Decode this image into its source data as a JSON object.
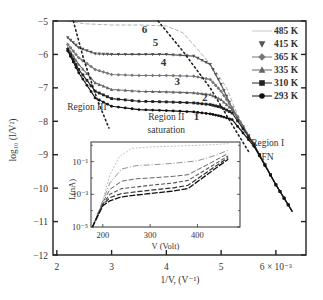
{
  "chart_data": {
    "type": "scatter",
    "title": "",
    "xlabel": "1/V, (V⁻¹)",
    "ylabel": "log10 (I/V²)",
    "xlim": [
      1.93,
      6.55
    ],
    "ylim": [
      -12,
      -5
    ],
    "x_ticks": [
      2,
      3,
      4,
      5,
      6
    ],
    "x_tick_labels": [
      "2",
      "3",
      "4",
      "5",
      "6 × 10⁻³"
    ],
    "y_ticks": [
      -5,
      -6,
      -7,
      -8,
      -9,
      -10,
      -11,
      -12
    ],
    "y_tick_labels": [
      "−5",
      "−6",
      "−7",
      "−8",
      "−9",
      "−10",
      "−11",
      "−12"
    ],
    "grid": false,
    "legend_position": "upper right",
    "legend": [
      "485 K",
      "415 K",
      "365 K",
      "335 K",
      "310 K",
      "293 K"
    ],
    "series": [
      {
        "name": "485 K",
        "curve_label": "6",
        "marker": "none",
        "color": "#b0b0b0",
        "x": [
          2.2,
          2.5,
          3.0,
          3.5,
          4.0,
          4.3,
          4.6,
          4.9,
          5.1,
          5.3,
          5.6,
          6.0,
          6.3
        ],
        "y": [
          -5.0,
          -5.08,
          -5.12,
          -5.12,
          -5.15,
          -5.35,
          -5.9,
          -6.5,
          -7.0,
          -7.8,
          -8.7,
          -9.9,
          -10.7
        ]
      },
      {
        "name": "415 K",
        "curve_label": "5",
        "marker": "triangle-down",
        "color": "#555555",
        "x": [
          2.2,
          2.4,
          2.7,
          3.0,
          3.5,
          4.0,
          4.5,
          4.8,
          5.0,
          5.2,
          5.6,
          6.0,
          6.3
        ],
        "y": [
          -5.5,
          -5.8,
          -5.98,
          -6.0,
          -6.0,
          -6.0,
          -6.05,
          -6.3,
          -6.9,
          -7.6,
          -8.7,
          -9.9,
          -10.7
        ]
      },
      {
        "name": "365 K",
        "curve_label": "4",
        "marker": "diamond",
        "color": "#777777",
        "x": [
          2.2,
          2.4,
          2.7,
          3.0,
          3.5,
          4.0,
          4.5,
          4.8,
          5.0,
          5.2,
          5.6,
          6.0,
          6.3
        ],
        "y": [
          -5.7,
          -6.1,
          -6.45,
          -6.6,
          -6.63,
          -6.63,
          -6.65,
          -6.75,
          -7.1,
          -7.6,
          -8.7,
          -9.9,
          -10.7
        ]
      },
      {
        "name": "335 K",
        "curve_label": "3",
        "marker": "triangle-up",
        "color": "#666666",
        "x": [
          2.2,
          2.4,
          2.7,
          3.0,
          3.5,
          4.0,
          4.5,
          4.8,
          5.0,
          5.2,
          5.6,
          6.0,
          6.3
        ],
        "y": [
          -5.8,
          -6.3,
          -6.85,
          -7.05,
          -7.1,
          -7.12,
          -7.15,
          -7.2,
          -7.35,
          -7.65,
          -8.7,
          -9.9,
          -10.7
        ]
      },
      {
        "name": "310 K",
        "curve_label": "2",
        "marker": "square",
        "color": "#222222",
        "x": [
          2.2,
          2.4,
          2.7,
          3.0,
          3.5,
          4.0,
          4.5,
          4.8,
          5.0,
          5.2,
          5.6,
          6.0,
          6.3
        ],
        "y": [
          -5.85,
          -6.45,
          -7.1,
          -7.32,
          -7.4,
          -7.42,
          -7.45,
          -7.5,
          -7.58,
          -7.75,
          -8.7,
          -9.9,
          -10.7
        ]
      },
      {
        "name": "293 K",
        "curve_label": "1",
        "marker": "circle",
        "color": "#111111",
        "x": [
          2.2,
          2.4,
          2.7,
          3.0,
          3.5,
          4.0,
          4.5,
          4.8,
          5.0,
          5.2,
          5.6,
          6.0,
          6.3
        ],
        "y": [
          -5.9,
          -6.55,
          -7.3,
          -7.55,
          -7.65,
          -7.68,
          -7.72,
          -7.78,
          -7.85,
          -7.95,
          -8.75,
          -9.9,
          -10.7
        ]
      }
    ],
    "guide_lines": [
      {
        "name": "Region III boundary",
        "style": "dotted",
        "x": [
          2.3,
          2.5,
          2.75,
          2.95
        ],
        "y": [
          -5.0,
          -6.2,
          -7.4,
          -8.2
        ]
      },
      {
        "name": "Region II/I boundary",
        "style": "dotted",
        "x": [
          3.85,
          4.3,
          4.8,
          5.2,
          5.5
        ],
        "y": [
          -5.0,
          -5.9,
          -7.0,
          -8.1,
          -8.9
        ]
      }
    ],
    "annotations": [
      {
        "text": "Region III",
        "x": 2.55,
        "y": -7.65
      },
      {
        "text": "Region II",
        "x": 4.0,
        "y": -7.95
      },
      {
        "text": "saturation",
        "x": 4.0,
        "y": -8.35
      },
      {
        "text": "Region I",
        "x": 5.85,
        "y": -8.75
      },
      {
        "text": "FN",
        "x": 5.85,
        "y": -9.15
      }
    ],
    "curve_label_positions": [
      {
        "label": "6",
        "x": 3.6,
        "y": -5.35
      },
      {
        "label": "5",
        "x": 3.8,
        "y": -5.75
      },
      {
        "label": "4",
        "x": 3.95,
        "y": -6.35
      },
      {
        "label": "3",
        "x": 4.2,
        "y": -6.9
      },
      {
        "label": "2",
        "x": 4.7,
        "y": -7.4
      },
      {
        "label": "1",
        "x": 4.55,
        "y": -7.95
      }
    ],
    "inset": {
      "type": "line",
      "xlabel": "V (Volt)",
      "ylabel": "I (nA)",
      "xlim": [
        175,
        490
      ],
      "ylim_log10": [
        -5,
        0.2
      ],
      "x_ticks": [
        200,
        300,
        400
      ],
      "x_tick_labels": [
        "200",
        "300",
        "400"
      ],
      "y_ticks_log10": [
        -1,
        -3,
        -5
      ],
      "y_tick_labels": [
        "10⁻¹",
        "10⁻³",
        "10⁻⁵"
      ],
      "series": [
        {
          "name": "485 K",
          "x": [
            178,
            200,
            215,
            235,
            260,
            300,
            350,
            400,
            440,
            465
          ],
          "log10_y": [
            -5.0,
            -3.4,
            -1.8,
            -0.7,
            -0.2,
            -0.1,
            -0.05,
            -0.0,
            0.05,
            0.1
          ]
        },
        {
          "name": "415 K",
          "x": [
            178,
            200,
            215,
            240,
            270,
            300,
            350,
            400,
            440,
            465
          ],
          "log10_y": [
            -5.0,
            -3.4,
            -2.3,
            -1.45,
            -1.25,
            -1.2,
            -1.1,
            -0.95,
            -0.6,
            -0.3
          ]
        },
        {
          "name": "365 K",
          "x": [
            178,
            200,
            215,
            240,
            270,
            300,
            350,
            380,
            420,
            465
          ],
          "log10_y": [
            -5.0,
            -3.5,
            -2.7,
            -2.2,
            -2.05,
            -2.0,
            -1.9,
            -1.8,
            -1.2,
            -0.5
          ]
        },
        {
          "name": "335 K",
          "x": [
            178,
            200,
            215,
            240,
            270,
            300,
            350,
            380,
            420,
            465
          ],
          "log10_y": [
            -5.0,
            -3.6,
            -3.0,
            -2.65,
            -2.55,
            -2.45,
            -2.3,
            -2.15,
            -1.45,
            -0.65
          ]
        },
        {
          "name": "310 K",
          "x": [
            178,
            200,
            215,
            240,
            270,
            300,
            350,
            380,
            420,
            465
          ],
          "log10_y": [
            -5.0,
            -3.65,
            -3.2,
            -2.95,
            -2.85,
            -2.75,
            -2.6,
            -2.45,
            -1.65,
            -0.75
          ]
        },
        {
          "name": "293 K",
          "x": [
            178,
            200,
            215,
            240,
            270,
            300,
            350,
            380,
            420,
            465
          ],
          "log10_y": [
            -5.0,
            -3.7,
            -3.4,
            -3.15,
            -3.05,
            -2.95,
            -2.8,
            -2.65,
            -1.8,
            -0.85
          ]
        }
      ]
    }
  },
  "figure": {
    "x_axis_title": "1/V, (V⁻¹)",
    "y_axis_title": "log₁₀ (I/V²)",
    "legend_items": [
      {
        "label": "485 K",
        "marker": "none"
      },
      {
        "label": "415 K",
        "marker": "triangle-down"
      },
      {
        "label": "365 K",
        "marker": "diamond"
      },
      {
        "label": "335 K",
        "marker": "triangle-up"
      },
      {
        "label": "310 K",
        "marker": "square"
      },
      {
        "label": "293 K",
        "marker": "circle"
      }
    ],
    "inset_x_title": "V (Volt)",
    "inset_y_title": "I (nA)"
  }
}
